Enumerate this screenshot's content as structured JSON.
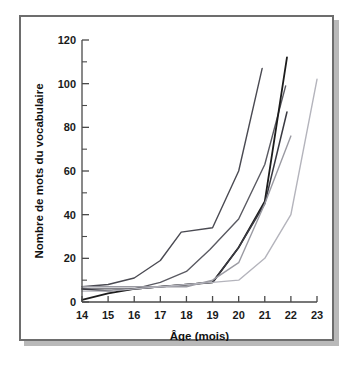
{
  "figure": {
    "name": "vocabulary-growth-curves",
    "background_color": "#ffffff",
    "frame_color": "#6d6d6d",
    "shadow_color": "#b9b9b9"
  },
  "chart_data": {
    "type": "line",
    "title": "",
    "xlabel": "Âge (mois)",
    "ylabel": "Nombre de mots du vocabulaire",
    "xlim": [
      14,
      23
    ],
    "ylim": [
      0,
      120
    ],
    "xticks": [
      14,
      15,
      16,
      17,
      18,
      19,
      20,
      21,
      22,
      23
    ],
    "xtick_labels": [
      "14",
      "15",
      "16",
      "17",
      "18",
      "19",
      "20",
      "21",
      "22",
      "23"
    ],
    "yticks": [
      0,
      20,
      40,
      60,
      80,
      100,
      120
    ],
    "ytick_labels": [
      "0",
      "20",
      "40",
      "60",
      "80",
      "100",
      "120"
    ],
    "y_minor_ticks": [
      10,
      30,
      50,
      70,
      90,
      110
    ],
    "grid": false,
    "legend": false,
    "legend_position": "none",
    "series": [
      {
        "name": "Enfant 1",
        "color": "#4a4a52",
        "width": 1.4,
        "x": [
          14,
          15,
          16,
          17,
          17.8,
          19,
          20,
          20.9
        ],
        "values": [
          7,
          8,
          11,
          19,
          32,
          34,
          60,
          107
        ]
      },
      {
        "name": "Enfant 2",
        "color": "#5a5a62",
        "width": 1.4,
        "x": [
          14,
          15,
          16,
          17,
          18,
          18.9,
          20,
          21,
          21.8
        ],
        "values": [
          6,
          6,
          6,
          9,
          14,
          24,
          38,
          63,
          99
        ]
      },
      {
        "name": "Enfant 3",
        "color": "#1c1c1c",
        "width": 1.8,
        "x": [
          14,
          15,
          16,
          17,
          18,
          19,
          20,
          21,
          21.85
        ],
        "values": [
          1,
          4,
          6,
          7,
          8,
          9,
          25,
          46,
          112
        ]
      },
      {
        "name": "Enfant 4",
        "color": "#3a3a42",
        "width": 1.5,
        "x": [
          14,
          15,
          16,
          17,
          18,
          19,
          20,
          21,
          21.85
        ],
        "values": [
          6,
          5,
          6,
          7,
          8,
          9,
          25,
          45,
          87
        ]
      },
      {
        "name": "Enfant 5",
        "color": "#9a9aa2",
        "width": 1.4,
        "x": [
          14,
          15,
          16,
          17,
          18,
          19,
          20,
          21,
          22
        ],
        "values": [
          7,
          7,
          7,
          7,
          7,
          10,
          18,
          45,
          76
        ]
      },
      {
        "name": "Enfant 6",
        "color": "#b4b4bc",
        "width": 1.4,
        "x": [
          14,
          15,
          16,
          17,
          18,
          19,
          20,
          21,
          22,
          23
        ],
        "values": [
          5,
          5,
          6,
          7,
          8,
          9,
          10,
          20,
          40,
          102
        ]
      }
    ]
  }
}
